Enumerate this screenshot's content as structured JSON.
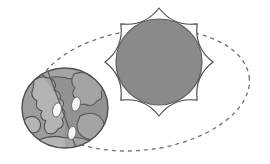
{
  "diagram": {
    "type": "astronomy-orbit-diagram",
    "background_color": "#ffffff",
    "width": 270,
    "height": 164
  },
  "orbit": {
    "label": "orbital path",
    "shape": "ellipse",
    "style": "dashed",
    "center_x": 142,
    "center_y": 90,
    "radius_x": 108,
    "radius_y": 60,
    "rotation_deg": -7,
    "stroke_color": "#6f6f6f",
    "stroke_width": 1.3,
    "dash_pattern": "4 4"
  },
  "sun": {
    "label": "Sun",
    "center_x": 159,
    "center_y": 62,
    "core_radius": 43,
    "core_color": "#8a8a8a",
    "core_stroke_color": "#5e5e5e",
    "corona_fill": "#fbfbfb",
    "corona_stroke": "#4a4a4a",
    "corona_points": 8,
    "corona_outer_radius": 54,
    "corona_inner_radius": 43
  },
  "earth": {
    "label": "Earth",
    "center_x": 65,
    "center_y": 108,
    "radius_x": 43,
    "radius_y": 40,
    "ocean_lit_color": "#9d9d9d",
    "ocean_dark_color": "#8b8b8b",
    "land_lit_color": "#b4b4b4",
    "land_dark_color": "#9a9a9a",
    "outline_color": "#4f4f4f",
    "terminator_color": "#5a5a5a",
    "cloud_color": "#f6f6f6",
    "cloud_stroke": "#6a6a6a",
    "cloud_count": 3,
    "terminator_label": "day-night terminator"
  }
}
